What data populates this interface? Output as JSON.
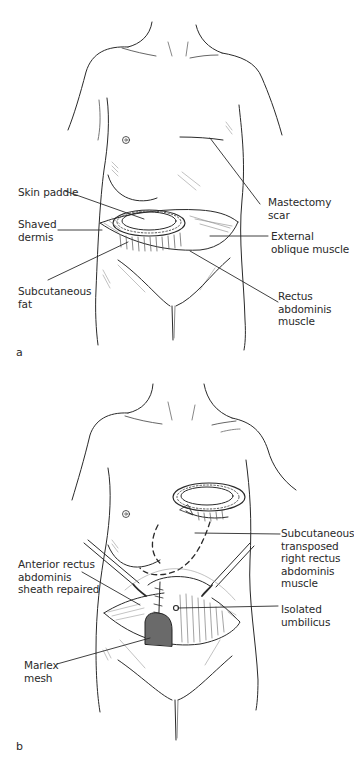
{
  "figure": {
    "panels": [
      {
        "id": "a",
        "letter": "a",
        "labels": {
          "skin_paddle": "Skin paddle",
          "shaved_dermis": "Shaved\ndermis",
          "subcutaneous_fat": "Subcutaneous\nfat",
          "mastectomy_scar": "Mastectomy\nscar",
          "external_oblique": "External\noblique muscle",
          "rectus_abdominis": "Rectus\nabdominis\nmuscle"
        }
      },
      {
        "id": "b",
        "letter": "b",
        "labels": {
          "anterior_rectus": "Anterior rectus\nabdominis\nsheath repaired",
          "marlex_mesh": "Marlex\nmesh",
          "subcutaneous_transposed": "Subcutaneous\ntransposed\nright rectus\nabdominis\nmuscle",
          "isolated_umbilicus": "Isolated\numbilicus"
        }
      }
    ],
    "colors": {
      "line": "#2a2a2a",
      "hatch": "#9a9a9a",
      "background": "#ffffff"
    }
  }
}
